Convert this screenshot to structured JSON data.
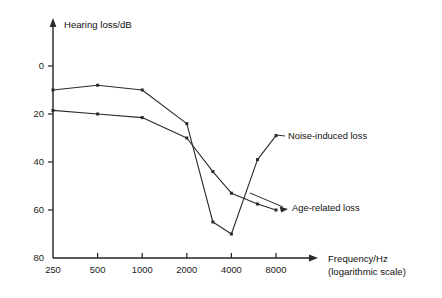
{
  "chart_data": {
    "type": "line",
    "title": "",
    "xlabel": "Frequency/Hz",
    "xlabel_sub": "(logarithmic scale)",
    "ylabel": "Hearing loss/dB",
    "x_scale": "logarithmic",
    "x_ticks": [
      "250",
      "500",
      "1000",
      "2000",
      "4000",
      "8000"
    ],
    "x_tick_values": [
      250,
      500,
      1000,
      2000,
      4000,
      8000
    ],
    "y_ticks": [
      "0",
      "20",
      "40",
      "60",
      "80"
    ],
    "y_tick_values": [
      0,
      20,
      40,
      60,
      80
    ],
    "ylim": [
      0,
      80
    ],
    "y_inverted": true,
    "grid": false,
    "legend_position": "inline-annotations",
    "series": [
      {
        "name": "Noise-induced loss",
        "x": [
          250,
          500,
          1000,
          2000,
          3000,
          4000,
          6000,
          8000
        ],
        "values": [
          10,
          8,
          10,
          24,
          65,
          70,
          39,
          29
        ]
      },
      {
        "name": "Age-related loss",
        "x": [
          250,
          500,
          1000,
          2000,
          3000,
          4000,
          6000,
          8000
        ],
        "values": [
          18.5,
          20,
          21.5,
          30,
          44,
          53,
          57.5,
          60
        ]
      }
    ],
    "annotations": [
      {
        "text": "Noise-induced loss",
        "points_to_series": "Noise-induced loss",
        "points_to_x": 8000
      },
      {
        "text": "Age-related loss",
        "points_to_series": "Age-related loss",
        "points_to_x": 8000
      }
    ]
  }
}
